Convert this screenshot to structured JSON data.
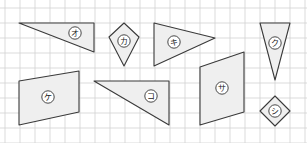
{
  "figure": {
    "width": 307,
    "height": 143,
    "grid": {
      "spacing": 15,
      "offset_x": 5,
      "offset_y": 8,
      "color": "#d2d2d2"
    },
    "colors": {
      "shape_fill": "#efefef",
      "shape_stroke": "#3a3a3a",
      "background": "#ffffff"
    },
    "shapes": [
      {
        "id": "o",
        "label": "オ",
        "kind": "right-triangle",
        "points": "19,23 94,23 94,52",
        "label_pos": [
          75,
          33
        ]
      },
      {
        "id": "ka",
        "label": "カ",
        "kind": "kite",
        "points": "124,23 139,37 124,66 109,37",
        "label_pos": [
          124,
          41
        ]
      },
      {
        "id": "ki",
        "label": "キ",
        "kind": "triangle",
        "points": "154,23 215,38 154,66",
        "label_pos": [
          174,
          42
        ]
      },
      {
        "id": "ku",
        "label": "ク",
        "kind": "isosceles-triangle",
        "points": "260,23 290,23 275,80",
        "label_pos": [
          275,
          43
        ]
      },
      {
        "id": "ke",
        "label": "ケ",
        "kind": "parallelogram",
        "points": "19,81 79,71 79,112 19,125",
        "label_pos": [
          48,
          97
        ]
      },
      {
        "id": "ko",
        "label": "コ",
        "kind": "right-triangle",
        "points": "94,81 169,81 169,125",
        "label_pos": [
          151,
          96
        ]
      },
      {
        "id": "sa",
        "label": "サ",
        "kind": "trapezoid",
        "points": "200,67 244,52 244,112 200,125",
        "label_pos": [
          222,
          88
        ]
      },
      {
        "id": "shi",
        "label": "シ",
        "kind": "square-rotated",
        "points": "275,96 290,111 275,126 260,111",
        "label_pos": [
          275,
          111
        ]
      }
    ]
  }
}
